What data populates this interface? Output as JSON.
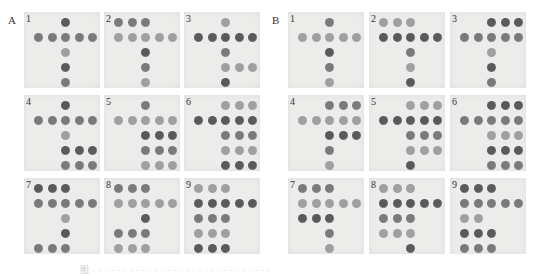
{
  "figure": {
    "top_text": "· · · · · · · · · · · · · · · · · · · · · · · · · · · · · · · · · · · · · · · ·",
    "caption": "图 · · · · · · · · · · · · · · · · · · · · · · · · · · · · ·",
    "panels": [
      {
        "label": "A",
        "membranes": [
          {
            "num": "1",
            "dots": [
              [
                0,
                2
              ],
              [
                1,
                0
              ],
              [
                1,
                1
              ],
              [
                1,
                2
              ],
              [
                1,
                3
              ],
              [
                1,
                4
              ],
              [
                2,
                2
              ],
              [
                3,
                2
              ],
              [
                4,
                2
              ]
            ]
          },
          {
            "num": "2",
            "dots": [
              [
                0,
                0
              ],
              [
                0,
                1
              ],
              [
                0,
                2
              ],
              [
                1,
                0
              ],
              [
                1,
                1
              ],
              [
                1,
                2
              ],
              [
                1,
                3
              ],
              [
                1,
                4
              ],
              [
                2,
                2
              ],
              [
                3,
                2
              ],
              [
                4,
                2
              ]
            ]
          },
          {
            "num": "3",
            "dots": [
              [
                0,
                2
              ],
              [
                1,
                0
              ],
              [
                1,
                1
              ],
              [
                1,
                2
              ],
              [
                1,
                3
              ],
              [
                1,
                4
              ],
              [
                2,
                2
              ],
              [
                3,
                2
              ],
              [
                3,
                3
              ],
              [
                3,
                4
              ],
              [
                4,
                2
              ]
            ]
          },
          {
            "num": "4",
            "dots": [
              [
                0,
                2
              ],
              [
                1,
                0
              ],
              [
                1,
                1
              ],
              [
                1,
                2
              ],
              [
                1,
                3
              ],
              [
                1,
                4
              ],
              [
                2,
                2
              ],
              [
                3,
                2
              ],
              [
                3,
                3
              ],
              [
                3,
                4
              ],
              [
                4,
                2
              ],
              [
                4,
                3
              ],
              [
                4,
                4
              ]
            ]
          },
          {
            "num": "5",
            "dots": [
              [
                0,
                2
              ],
              [
                1,
                0
              ],
              [
                1,
                1
              ],
              [
                1,
                2
              ],
              [
                1,
                3
              ],
              [
                1,
                4
              ],
              [
                2,
                2
              ],
              [
                2,
                3
              ],
              [
                2,
                4
              ],
              [
                3,
                2
              ],
              [
                3,
                3
              ],
              [
                3,
                4
              ],
              [
                4,
                2
              ],
              [
                4,
                3
              ],
              [
                4,
                4
              ]
            ]
          },
          {
            "num": "6",
            "dots": [
              [
                0,
                2
              ],
              [
                0,
                3
              ],
              [
                0,
                4
              ],
              [
                1,
                0
              ],
              [
                1,
                1
              ],
              [
                1,
                2
              ],
              [
                1,
                3
              ],
              [
                1,
                4
              ],
              [
                2,
                2
              ],
              [
                2,
                3
              ],
              [
                2,
                4
              ],
              [
                3,
                2
              ],
              [
                3,
                3
              ],
              [
                3,
                4
              ],
              [
                4,
                2
              ],
              [
                4,
                3
              ],
              [
                4,
                4
              ]
            ]
          },
          {
            "num": "7",
            "dots": [
              [
                0,
                0
              ],
              [
                0,
                1
              ],
              [
                0,
                2
              ],
              [
                1,
                0
              ],
              [
                1,
                1
              ],
              [
                1,
                2
              ],
              [
                1,
                3
              ],
              [
                1,
                4
              ],
              [
                2,
                2
              ],
              [
                3,
                2
              ],
              [
                4,
                0
              ],
              [
                4,
                1
              ],
              [
                4,
                2
              ]
            ]
          },
          {
            "num": "8",
            "dots": [
              [
                0,
                0
              ],
              [
                0,
                1
              ],
              [
                0,
                2
              ],
              [
                1,
                0
              ],
              [
                1,
                1
              ],
              [
                1,
                2
              ],
              [
                1,
                3
              ],
              [
                1,
                4
              ],
              [
                2,
                2
              ],
              [
                3,
                0
              ],
              [
                3,
                1
              ],
              [
                3,
                2
              ],
              [
                4,
                0
              ],
              [
                4,
                1
              ],
              [
                4,
                2
              ]
            ]
          },
          {
            "num": "9",
            "dots": [
              [
                0,
                0
              ],
              [
                0,
                1
              ],
              [
                0,
                2
              ],
              [
                1,
                0
              ],
              [
                1,
                1
              ],
              [
                1,
                2
              ],
              [
                1,
                3
              ],
              [
                1,
                4
              ],
              [
                2,
                0
              ],
              [
                2,
                1
              ],
              [
                2,
                2
              ],
              [
                3,
                0
              ],
              [
                3,
                1
              ],
              [
                3,
                2
              ],
              [
                4,
                0
              ],
              [
                4,
                1
              ],
              [
                4,
                2
              ]
            ]
          }
        ]
      },
      {
        "label": "B",
        "membranes": [
          {
            "num": "1",
            "dots": [
              [
                0,
                2
              ],
              [
                1,
                0
              ],
              [
                1,
                1
              ],
              [
                1,
                2
              ],
              [
                1,
                3
              ],
              [
                1,
                4
              ],
              [
                2,
                2
              ],
              [
                3,
                2
              ],
              [
                4,
                2
              ]
            ]
          },
          {
            "num": "2",
            "dots": [
              [
                0,
                0
              ],
              [
                0,
                1
              ],
              [
                0,
                2
              ],
              [
                1,
                0
              ],
              [
                1,
                1
              ],
              [
                1,
                2
              ],
              [
                1,
                3
              ],
              [
                1,
                4
              ],
              [
                2,
                2
              ],
              [
                3,
                2
              ],
              [
                4,
                2
              ]
            ]
          },
          {
            "num": "3",
            "dots": [
              [
                0,
                2
              ],
              [
                0,
                3
              ],
              [
                0,
                4
              ],
              [
                1,
                0
              ],
              [
                1,
                1
              ],
              [
                1,
                2
              ],
              [
                1,
                3
              ],
              [
                1,
                4
              ],
              [
                2,
                2
              ],
              [
                3,
                2
              ],
              [
                4,
                2
              ]
            ]
          },
          {
            "num": "4",
            "dots": [
              [
                0,
                2
              ],
              [
                0,
                3
              ],
              [
                0,
                4
              ],
              [
                1,
                0
              ],
              [
                1,
                1
              ],
              [
                1,
                2
              ],
              [
                1,
                3
              ],
              [
                1,
                4
              ],
              [
                2,
                2
              ],
              [
                2,
                3
              ],
              [
                2,
                4
              ],
              [
                3,
                2
              ],
              [
                4,
                2
              ]
            ]
          },
          {
            "num": "5",
            "dots": [
              [
                0,
                2
              ],
              [
                0,
                3
              ],
              [
                0,
                4
              ],
              [
                1,
                0
              ],
              [
                1,
                1
              ],
              [
                1,
                2
              ],
              [
                1,
                3
              ],
              [
                1,
                4
              ],
              [
                2,
                2
              ],
              [
                2,
                3
              ],
              [
                2,
                4
              ],
              [
                3,
                2
              ],
              [
                3,
                3
              ],
              [
                3,
                4
              ],
              [
                4,
                2
              ]
            ]
          },
          {
            "num": "6",
            "dots": [
              [
                0,
                2
              ],
              [
                0,
                3
              ],
              [
                0,
                4
              ],
              [
                1,
                0
              ],
              [
                1,
                1
              ],
              [
                1,
                2
              ],
              [
                1,
                3
              ],
              [
                1,
                4
              ],
              [
                2,
                2
              ],
              [
                2,
                3
              ],
              [
                2,
                4
              ],
              [
                3,
                2
              ],
              [
                3,
                3
              ],
              [
                3,
                4
              ],
              [
                4,
                2
              ],
              [
                4,
                3
              ],
              [
                4,
                4
              ]
            ]
          },
          {
            "num": "7",
            "dots": [
              [
                0,
                0
              ],
              [
                0,
                1
              ],
              [
                0,
                2
              ],
              [
                1,
                0
              ],
              [
                1,
                1
              ],
              [
                1,
                2
              ],
              [
                1,
                3
              ],
              [
                1,
                4
              ],
              [
                2,
                0
              ],
              [
                2,
                1
              ],
              [
                2,
                2
              ],
              [
                3,
                2
              ],
              [
                4,
                2
              ]
            ]
          },
          {
            "num": "8",
            "dots": [
              [
                0,
                0
              ],
              [
                0,
                1
              ],
              [
                0,
                2
              ],
              [
                1,
                0
              ],
              [
                1,
                1
              ],
              [
                1,
                2
              ],
              [
                1,
                3
              ],
              [
                1,
                4
              ],
              [
                2,
                0
              ],
              [
                2,
                1
              ],
              [
                2,
                2
              ],
              [
                3,
                0
              ],
              [
                3,
                1
              ],
              [
                3,
                2
              ],
              [
                4,
                2
              ]
            ]
          },
          {
            "num": "9",
            "dots": [
              [
                0,
                0
              ],
              [
                0,
                1
              ],
              [
                0,
                2
              ],
              [
                1,
                0
              ],
              [
                1,
                1
              ],
              [
                1,
                2
              ],
              [
                1,
                3
              ],
              [
                1,
                4
              ],
              [
                2,
                0
              ],
              [
                2,
                1
              ],
              [
                3,
                0
              ],
              [
                3,
                1
              ],
              [
                3,
                2
              ],
              [
                4,
                0
              ],
              [
                4,
                1
              ],
              [
                4,
                2
              ]
            ]
          }
        ]
      }
    ],
    "colors": {
      "membrane_bg": "#ececea",
      "dot_dark": "#5a5a5a",
      "dot_mid": "#7a7a7a",
      "dot_light": "#a0a0a0"
    }
  }
}
